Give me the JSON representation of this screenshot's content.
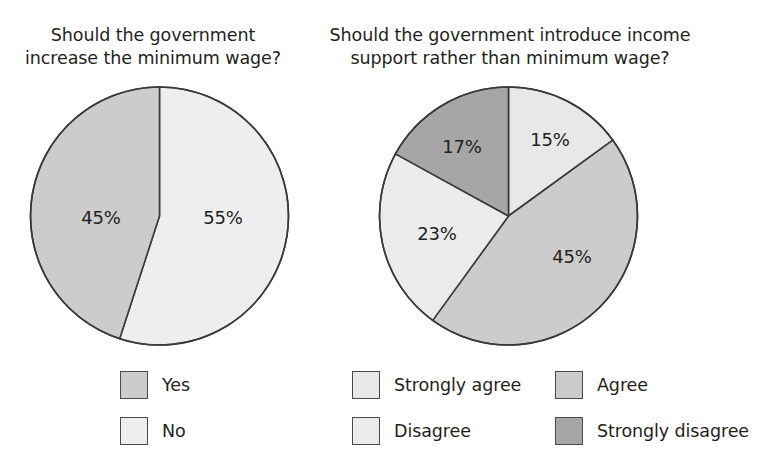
{
  "page": {
    "background": "#ffffff",
    "width": 775,
    "height": 464
  },
  "palette": {
    "very_light": "#eeeeee",
    "light": "#e0e0e0",
    "medium": "#cccccc",
    "dark": "#a6a6a6",
    "outline": "#3a3a3a",
    "text": "#231f20"
  },
  "chart_data": [
    {
      "id": "minimum-wage-pie",
      "type": "pie",
      "title": "Should the government\nincrease the minimum wage?",
      "categories": [
        "Yes",
        "No"
      ],
      "values": [
        45,
        55
      ],
      "value_labels": [
        "45%",
        "55%"
      ],
      "colors": [
        "#cccccc",
        "#eeeeee"
      ],
      "legend_position": "bottom",
      "legend": [
        {
          "label": "Yes",
          "color": "#cccccc"
        },
        {
          "label": "No",
          "color": "#eeeeee"
        }
      ],
      "slice_labels": [
        {
          "text": "45%",
          "x": 101,
          "y": 217
        },
        {
          "text": "55%",
          "x": 223,
          "y": 217
        }
      ],
      "geometry": {
        "cx": 159.5,
        "cy": 216,
        "r": 129,
        "start_angle_deg": 0
      },
      "slices_clockwise_from_12": [
        {
          "name": "No",
          "percent": 55,
          "color": "#eeeeee"
        },
        {
          "name": "Yes",
          "percent": 45,
          "color": "#cccccc"
        }
      ]
    },
    {
      "id": "income-support-pie",
      "type": "pie",
      "title": "Should the government introduce income\nsupport rather than minimum wage?",
      "categories": [
        "Strongly agree",
        "Agree",
        "Disagree",
        "Strongly disagree"
      ],
      "values": [
        15,
        45,
        23,
        17
      ],
      "value_labels": [
        "15%",
        "45%",
        "23%",
        "17%"
      ],
      "colors": [
        "#e8e8e8",
        "#cccccc",
        "#ebebeb",
        "#a6a6a6"
      ],
      "legend_position": "bottom",
      "legend": [
        {
          "label": "Strongly agree",
          "color": "#e8e8e8"
        },
        {
          "label": "Agree",
          "color": "#cccccc"
        },
        {
          "label": "Disagree",
          "color": "#ebebeb"
        },
        {
          "label": "Strongly disagree",
          "color": "#a6a6a6"
        }
      ],
      "slice_labels": [
        {
          "text": "15%",
          "x": 550,
          "y": 139
        },
        {
          "text": "45%",
          "x": 572,
          "y": 256
        },
        {
          "text": "23%",
          "x": 437,
          "y": 233
        },
        {
          "text": "17%",
          "x": 462,
          "y": 146
        }
      ],
      "geometry": {
        "cx": 508.5,
        "cy": 216,
        "r": 129,
        "start_angle_deg": 0
      },
      "slices_clockwise_from_12": [
        {
          "name": "Strongly agree",
          "percent": 15,
          "color": "#e8e8e8"
        },
        {
          "name": "Agree",
          "percent": 45,
          "color": "#cccccc"
        },
        {
          "name": "Disagree",
          "percent": 23,
          "color": "#ebebeb"
        },
        {
          "name": "Strongly disagree",
          "percent": 17,
          "color": "#a6a6a6"
        }
      ]
    }
  ],
  "legend_layout": {
    "left": [
      {
        "label": "Yes",
        "x": 120,
        "y": 371
      },
      {
        "label": "No",
        "x": 120,
        "y": 417
      }
    ],
    "right": [
      {
        "label": "Strongly agree",
        "x": 352,
        "y": 371
      },
      {
        "label": "Agree",
        "x": 555,
        "y": 371
      },
      {
        "label": "Disagree",
        "x": 352,
        "y": 417
      },
      {
        "label": "Strongly disagree",
        "x": 555,
        "y": 417
      }
    ]
  }
}
